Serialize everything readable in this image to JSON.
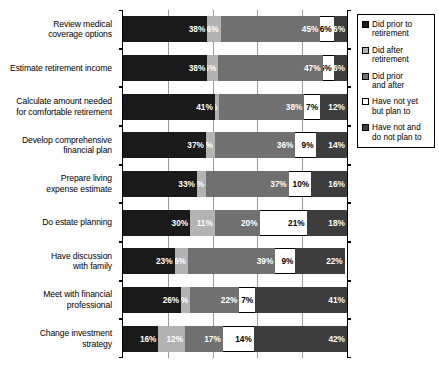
{
  "chart_data": {
    "type": "bar",
    "orientation": "horizontal",
    "stacked": true,
    "stack_total": 100,
    "title": "",
    "subtitle": "",
    "xlabel": "",
    "ylabel": "",
    "xlim": [
      0,
      100
    ],
    "xticks": [
      0,
      20,
      40,
      60,
      80,
      100
    ],
    "xticklabels": [
      "",
      "",
      "",
      "",
      "",
      ""
    ],
    "grid": true,
    "grid_axis": "x",
    "legend_position": "right",
    "categories": [
      "Review medical coverage options",
      "Estimate retirement income",
      "Calculate amount needed for comfortable retirement",
      "Develop comprehensive financial plan",
      "Prepare living expense estimate",
      "Do estate planning",
      "Have discussion with family",
      "Meet with financial professional",
      "Change investment strategy"
    ],
    "series": [
      {
        "name": "Did prior to retirement",
        "color": "#1a1a1a",
        "values": [
          38,
          38,
          41,
          37,
          33,
          30,
          23,
          26,
          16
        ]
      },
      {
        "name": "Did after retirement",
        "color": "#b3b3b3",
        "values": [
          6,
          5,
          2,
          4,
          4,
          11,
          6,
          4,
          12
        ]
      },
      {
        "name": "Did prior and after",
        "color": "#707070",
        "values": [
          45,
          47,
          38,
          36,
          37,
          20,
          39,
          22,
          17
        ]
      },
      {
        "name": "Have not yet but plan to",
        "color": "#ffffff",
        "values": [
          6,
          5,
          7,
          9,
          10,
          21,
          9,
          7,
          14
        ]
      },
      {
        "name": "Have not and do not plan to",
        "color": "#3d3d3d",
        "values": [
          6,
          6,
          12,
          14,
          16,
          18,
          22,
          41,
          42
        ]
      }
    ],
    "value_labels": [
      [
        "38%",
        "6%",
        "45%",
        "6%",
        "6%"
      ],
      [
        "38%",
        "5%",
        "47%",
        "5%",
        "6%"
      ],
      [
        "41%",
        "2%",
        "38%",
        "7%",
        "12%"
      ],
      [
        "37%",
        "4%",
        "36%",
        "9%",
        "14%"
      ],
      [
        "33%",
        "4%",
        "37%",
        "10%",
        "16%"
      ],
      [
        "30%",
        "11%",
        "20%",
        "21%",
        "18%"
      ],
      [
        "23%",
        "6%",
        "39%",
        "9%",
        "22%"
      ],
      [
        "26%",
        "4%",
        "22%",
        "7%",
        "41%"
      ],
      [
        "16%",
        "12%",
        "17%",
        "14%",
        "42%"
      ]
    ]
  },
  "category_labels": [
    {
      "line1": "Review medical",
      "line2": "coverage options"
    },
    {
      "line1": "Estimate retirement income",
      "line2": ""
    },
    {
      "line1": "Calculate amount needed",
      "line2": "for comfortable retirement"
    },
    {
      "line1": "Develop comprehensive",
      "line2": "financial plan"
    },
    {
      "line1": "Prepare living",
      "line2": "expense estimate"
    },
    {
      "line1": "Do estate planning",
      "line2": ""
    },
    {
      "line1": "Have discussion",
      "line2": "with family"
    },
    {
      "line1": "Meet with financial",
      "line2": "professional"
    },
    {
      "line1": "Change investment",
      "line2": "strategy"
    }
  ],
  "legend": {
    "items": [
      {
        "line1": "Did prior to",
        "line2": "retirement",
        "color": "#1a1a1a"
      },
      {
        "line1": "Did after",
        "line2": "retirement",
        "color": "#b3b3b3"
      },
      {
        "line1": "Did prior",
        "line2": "and after",
        "color": "#707070"
      },
      {
        "line1": "Have not yet",
        "line2": "but plan to",
        "color": "#ffffff"
      },
      {
        "line1": "Have not and",
        "line2": "do not plan to",
        "color": "#3d3d3d"
      }
    ]
  }
}
